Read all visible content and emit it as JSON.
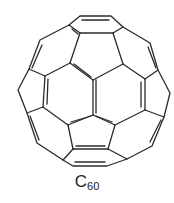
{
  "molecule": {
    "name": "fullerene",
    "formula_base": "C",
    "formula_subscript": "60"
  },
  "colors": {
    "bond": "#2b2b2b",
    "background": "#ffffff"
  },
  "structure": {
    "outer_ring": [
      [
        80,
        16
      ],
      [
        111,
        16
      ],
      [
        123,
        27
      ],
      [
        150,
        43
      ],
      [
        158,
        70
      ],
      [
        170,
        93
      ],
      [
        164,
        117
      ],
      [
        152,
        146
      ],
      [
        127,
        159
      ],
      [
        107,
        166
      ],
      [
        73,
        166
      ],
      [
        63,
        160
      ],
      [
        37,
        143
      ],
      [
        27,
        113
      ],
      [
        18,
        90
      ],
      [
        29,
        69
      ],
      [
        40,
        40
      ],
      [
        69,
        25
      ]
    ],
    "inner_bonds": [
      [
        [
          69,
          25
        ],
        [
          80,
          33
        ]
      ],
      [
        [
          123,
          27
        ],
        [
          113,
          33
        ]
      ],
      [
        [
          80,
          33
        ],
        [
          113,
          33
        ]
      ],
      [
        [
          80,
          33
        ],
        [
          70,
          63
        ]
      ],
      [
        [
          113,
          33
        ],
        [
          123,
          64
        ]
      ],
      [
        [
          70,
          63
        ],
        [
          93,
          80
        ]
      ],
      [
        [
          123,
          64
        ],
        [
          93,
          80
        ]
      ],
      [
        [
          93,
          80
        ],
        [
          93,
          115
        ]
      ],
      [
        [
          70,
          63
        ],
        [
          45,
          76
        ]
      ],
      [
        [
          123,
          64
        ],
        [
          145,
          79
        ]
      ],
      [
        [
          29,
          69
        ],
        [
          45,
          76
        ]
      ],
      [
        [
          158,
          70
        ],
        [
          145,
          79
        ]
      ],
      [
        [
          45,
          76
        ],
        [
          43,
          107
        ]
      ],
      [
        [
          145,
          79
        ],
        [
          145,
          110
        ]
      ],
      [
        [
          43,
          107
        ],
        [
          27,
          113
        ]
      ],
      [
        [
          145,
          110
        ],
        [
          164,
          117
        ]
      ],
      [
        [
          43,
          107
        ],
        [
          68,
          125
        ]
      ],
      [
        [
          145,
          110
        ],
        [
          115,
          125
        ]
      ],
      [
        [
          93,
          115
        ],
        [
          68,
          125
        ]
      ],
      [
        [
          93,
          115
        ],
        [
          115,
          125
        ]
      ],
      [
        [
          68,
          125
        ],
        [
          73,
          149
        ]
      ],
      [
        [
          115,
          125
        ],
        [
          108,
          149
        ]
      ],
      [
        [
          73,
          149
        ],
        [
          108,
          149
        ]
      ],
      [
        [
          73,
          149
        ],
        [
          63,
          160
        ]
      ],
      [
        [
          108,
          149
        ],
        [
          127,
          159
        ]
      ]
    ],
    "double_bonds": [
      [
        [
          82,
          20
        ],
        [
          109,
          20
        ]
      ],
      [
        [
          72,
          29
        ],
        [
          78,
          34
        ]
      ],
      [
        [
          42,
          45
        ],
        [
          32,
          68
        ]
      ],
      [
        [
          148,
          47
        ],
        [
          156,
          68
        ]
      ],
      [
        [
          74,
          64
        ],
        [
          91,
          77
        ]
      ],
      [
        [
          96,
          80
        ],
        [
          96,
          113
        ]
      ],
      [
        [
          48,
          79
        ],
        [
          47,
          104
        ]
      ],
      [
        [
          141,
          82
        ],
        [
          141,
          107
        ]
      ],
      [
        [
          30,
          116
        ],
        [
          39,
          140
        ]
      ],
      [
        [
          161,
          120
        ],
        [
          150,
          142
        ]
      ],
      [
        [
          71,
          122
        ],
        [
          91,
          116
        ]
      ],
      [
        [
          112,
          122
        ],
        [
          96,
          116
        ]
      ],
      [
        [
          76,
          146
        ],
        [
          105,
          146
        ]
      ],
      [
        [
          75,
          162
        ],
        [
          105,
          162
        ]
      ]
    ]
  }
}
